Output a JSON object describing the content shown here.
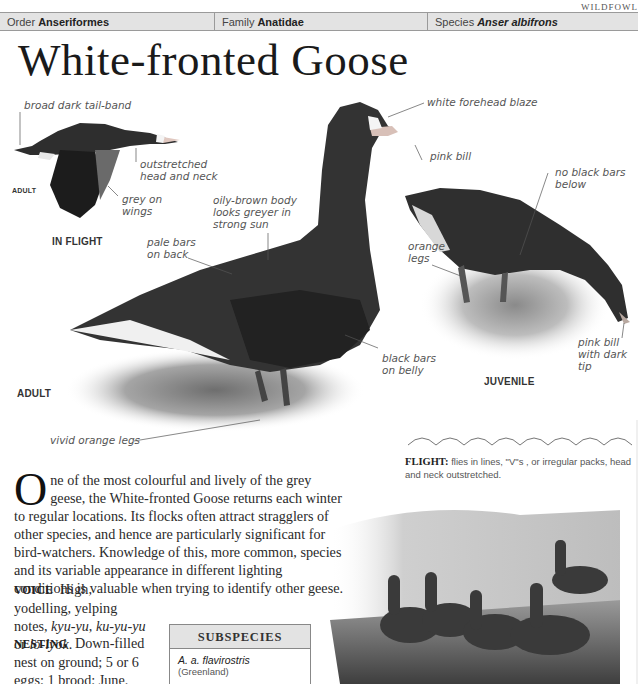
{
  "running_head": "WILDFOWL",
  "taxonomy": {
    "order_label": "Order",
    "order_value": "Anseriformes",
    "family_label": "Family",
    "family_value": "Anatidae",
    "species_label": "Species",
    "species_value": "Anser albifrons"
  },
  "title": "White-fronted Goose",
  "in_flight": {
    "caption": "IN FLIGHT",
    "age_tag": "ADULT",
    "labels": {
      "tail_band": "broad dark tail-band",
      "head_neck": [
        "outstretched",
        "head and neck"
      ],
      "grey_wings": [
        "grey on",
        "wings"
      ]
    }
  },
  "adult": {
    "caption": "ADULT",
    "labels": {
      "forehead": "white forehead blaze",
      "bill": "pink bill",
      "body": [
        "oily-brown body",
        "looks greyer in",
        "strong sun"
      ],
      "back": [
        "pale bars",
        "on back"
      ],
      "belly": [
        "black bars",
        "on belly"
      ],
      "legs": "vivid orange legs"
    }
  },
  "juvenile": {
    "caption": "JUVENILE",
    "labels": {
      "no_bars": [
        "no black bars",
        "below"
      ],
      "legs": [
        "orange",
        "legs"
      ],
      "bill": [
        "pink bill",
        "with dark",
        "tip"
      ]
    }
  },
  "flight_note": {
    "heading": "FLIGHT:",
    "text": "flies in lines, \"V\"s , or irregular packs, head and neck outstretched."
  },
  "description": {
    "dropcap": "O",
    "text": "ne of the most colourful and lively of the grey geese, the White-fronted Goose returns each winter to regular locations. Its flocks often attract stragglers of other species, and hence are particularly significant for bird-watchers. Knowledge of this, more common, species and its variable appearance in different lighting conditions is valuable when trying to identify other geese."
  },
  "voice": {
    "heading": "VOICE",
    "text_a": "High, yodelling, yelping notes,",
    "calls": [
      "kyu-yu",
      "ku-yu-yu",
      "lo-lyok"
    ],
    "sep_1": ", ",
    "sep_2": " or ",
    "end": "."
  },
  "nesting": {
    "heading": "NESTING",
    "text": "Down-filled nest on ground; 5 or 6 eggs; 1 brood; June."
  },
  "subspecies": {
    "heading": "SUBSPECIES",
    "name": "A. a. flavirostris",
    "region": "(Greenland)"
  },
  "colors": {
    "bar_bg": "#e3e3e3",
    "rule": "#9a9a9a",
    "text": "#2a2a2a",
    "label": "#555555"
  }
}
